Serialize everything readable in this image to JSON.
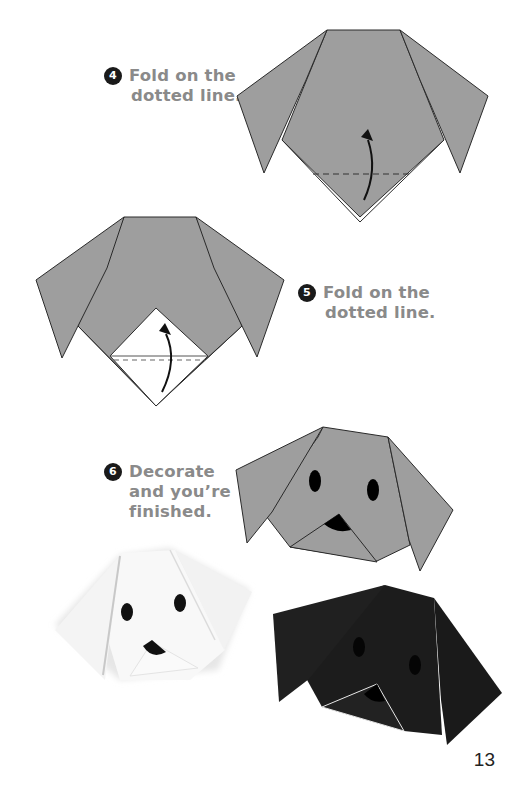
{
  "page": {
    "number": "13"
  },
  "steps": [
    {
      "number": "4",
      "lines": [
        "Fold on the",
        "dotted line."
      ]
    },
    {
      "number": "5",
      "lines": [
        "Fold on the",
        "dotted line."
      ]
    },
    {
      "number": "6",
      "lines": [
        "Decorate",
        "and you’re",
        "finished."
      ]
    }
  ],
  "illustrations": [
    {
      "id": "step4-diagram",
      "description": "gray paper dog head, bottom triangle with dashed fold line and curved arrow"
    },
    {
      "id": "step5-diagram",
      "description": "gray dog head with white triangle nose flap, dashed fold line and curved arrow"
    },
    {
      "id": "step6-diagram",
      "description": "finished gray dog head with eyes and nose"
    },
    {
      "id": "photo-white-dog",
      "description": "white origami dog with black eyes and nose"
    },
    {
      "id": "photo-black-dog",
      "description": "black origami dog"
    }
  ],
  "colors": {
    "paper_gray": "#9e9e9e",
    "outline": "#2a2a2a",
    "text_gray": "#8a8a8a",
    "badge": "#1a1a1a",
    "black_dog": "#1c1c1c"
  }
}
